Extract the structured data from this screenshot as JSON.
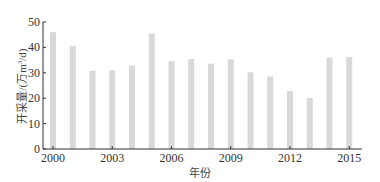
{
  "chart_data": {
    "type": "bar",
    "title": "",
    "xlabel": "年份",
    "ylabel": "开采量/(万m³/d)",
    "ylabel_parts": {
      "main": "开采量/(万m",
      "sup": "3",
      "tail": "/d)"
    },
    "ylim": [
      0,
      50
    ],
    "yticks": [
      0,
      10,
      20,
      30,
      40,
      50
    ],
    "categories": [
      "2000",
      "2001",
      "2002",
      "2003",
      "2004",
      "2005",
      "2006",
      "2007",
      "2008",
      "2009",
      "2010",
      "2011",
      "2012",
      "2013",
      "2014",
      "2015"
    ],
    "xtick_labels": [
      "2000",
      "2003",
      "2006",
      "2009",
      "2012",
      "2015"
    ],
    "values": [
      46,
      40.5,
      30.8,
      31,
      32.8,
      45.5,
      34.6,
      35.4,
      33.6,
      35.3,
      30.2,
      28.6,
      22.8,
      20.1,
      36,
      36.2
    ],
    "bar_color": "#d9d9d9",
    "grid": false,
    "legend": null
  }
}
